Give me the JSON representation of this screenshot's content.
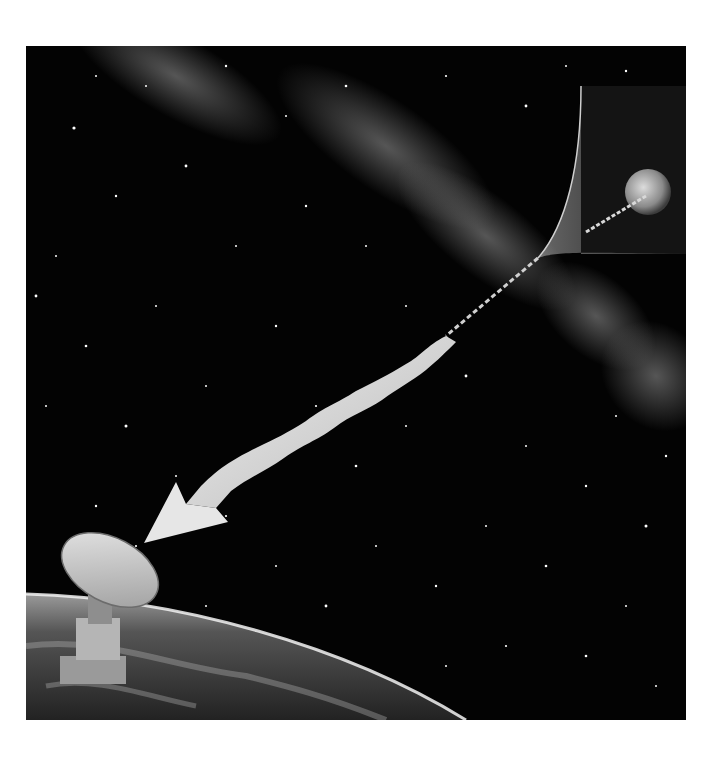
{
  "image": {
    "description": "Black-and-white space illustration: a distant Earth-like planet inside an inset panel emits a wave that travels across a starfield and Milky Way band, widening into a twisted ribbon arrow pointing at a radio telescope dish standing on Earth's curved surface.",
    "elements": {
      "background": "starfield-with-milky-way",
      "inset_panel": "distant-planet-panel",
      "signal": "twisted-ribbon-arrow",
      "receiver": "radio-telescope-dish",
      "ground": "earth-horizon"
    },
    "colors": {
      "space": "#030303",
      "star": "#ffffff",
      "milky_way": "#8a8a8a",
      "ribbon_light": "#e6e6e6",
      "ribbon_dark": "#8c8c8c",
      "earth_dark": "#3a3a3a",
      "earth_glow": "#f2f2f2"
    }
  }
}
